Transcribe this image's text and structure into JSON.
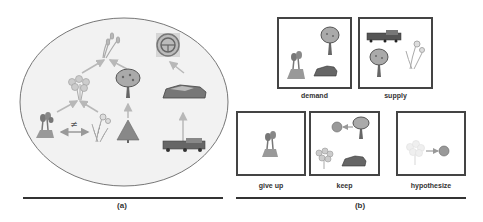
{
  "panel_a": {
    "caption": "(a)",
    "not_equal_symbol": "≠",
    "nodes": [
      "wheat",
      "flower-bouquet",
      "fruit-tree",
      "steering-wheel-badge",
      "tulips",
      "daffodil",
      "pine-tree",
      "sports-car",
      "truck-train"
    ],
    "relations": [
      {
        "from": "flower-bouquet",
        "to": "wheat"
      },
      {
        "from": "fruit-tree",
        "to": "wheat"
      },
      {
        "from": "tulips",
        "to": "flower-bouquet"
      },
      {
        "from": "daffodil",
        "to": "flower-bouquet"
      },
      {
        "from": "pine-tree",
        "to": "fruit-tree"
      },
      {
        "from": "sports-car",
        "to": "steering-wheel-badge"
      },
      {
        "from": "truck-train",
        "to": "sports-car"
      },
      {
        "between": [
          "tulips",
          "daffodil"
        ],
        "type": "not-equal"
      }
    ]
  },
  "panel_b": {
    "caption": "(b)",
    "boxes": [
      {
        "id": "demand",
        "label": "demand",
        "items": [
          "fruit-tree",
          "tulips",
          "sports-car"
        ]
      },
      {
        "id": "supply",
        "label": "supply",
        "items": [
          "truck-train",
          "daffodil",
          "fruit-tree"
        ]
      },
      {
        "id": "give-up",
        "label": "give up",
        "items": [
          "tulips"
        ]
      },
      {
        "id": "keep",
        "label": "keep",
        "items": [
          "orange-ball",
          "fruit-tree",
          "flower-bouquet",
          "sports-car"
        ]
      },
      {
        "id": "hypothesize",
        "label": "hypothesize",
        "items": [
          "faded-flower-bouquet",
          "orange-ball"
        ]
      }
    ]
  },
  "colors": {
    "ellipse_fill": "#f2f2f2",
    "ellipse_stroke": "#777777",
    "box_border": "#444444",
    "arrow": "#b8b8b8",
    "icon_gray": "#8a8a8a",
    "icon_dark": "#5a5a5a",
    "ball": "#9a9a9a"
  }
}
